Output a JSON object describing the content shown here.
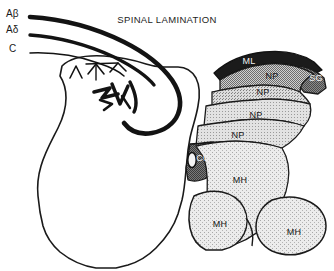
{
  "figure": {
    "title": "SPINAL LAMINATION",
    "width": 334,
    "height": 271,
    "background_color": "#ffffff",
    "ink_color": "#1a1a1a"
  },
  "fiber_labels": [
    {
      "text": "Aβ",
      "x": 6,
      "y": 8,
      "name": "fiber-label-a-beta"
    },
    {
      "text": "Aδ",
      "x": 6,
      "y": 24,
      "name": "fiber-label-a-delta"
    },
    {
      "text": "C",
      "x": 9,
      "y": 43,
      "name": "fiber-label-c"
    }
  ],
  "region_labels": [
    {
      "text": "ML",
      "x": 249,
      "y": 61,
      "tone": "light",
      "name": "region-label-ml"
    },
    {
      "text": "SG",
      "x": 316,
      "y": 78,
      "tone": "light",
      "name": "region-label-sg"
    },
    {
      "text": "NP",
      "x": 272,
      "y": 76,
      "tone": "dark",
      "name": "region-label-np-1"
    },
    {
      "text": "NP",
      "x": 263,
      "y": 92,
      "tone": "dark",
      "name": "region-label-np-2"
    },
    {
      "text": "NP",
      "x": 256,
      "y": 115,
      "tone": "dark",
      "name": "region-label-np-3"
    },
    {
      "text": "NP",
      "x": 238,
      "y": 135,
      "tone": "dark",
      "name": "region-label-np-4"
    },
    {
      "text": "CC",
      "x": 203,
      "y": 158,
      "tone": "light",
      "name": "region-label-cc"
    },
    {
      "text": "MH",
      "x": 240,
      "y": 180,
      "tone": "dark",
      "name": "region-label-mh-1"
    },
    {
      "text": "MH",
      "x": 220,
      "y": 224,
      "tone": "dark",
      "name": "region-label-mh-2"
    },
    {
      "text": "MH",
      "x": 294,
      "y": 232,
      "tone": "dark",
      "name": "region-label-mh-3"
    }
  ],
  "legend_terms": {
    "ML": "marginal layer",
    "SG": "substantia gelatinosa",
    "NP": "nucleus proprius",
    "CC": "central canal",
    "MH": "motor horn"
  },
  "shading": {
    "marginal_layer": "#1b1b1b",
    "substantia_gelatinosa": "#6f6f6f",
    "nucleus_proprius_dark": "#9a9a9a",
    "nucleus_proprius_mid": "#b4b4b4",
    "nucleus_proprius_light": "#c4c4c4",
    "central_canal_region": "#5a5a5a",
    "motor_horn": "#d8d8d8",
    "white_matter": "#ffffff"
  }
}
